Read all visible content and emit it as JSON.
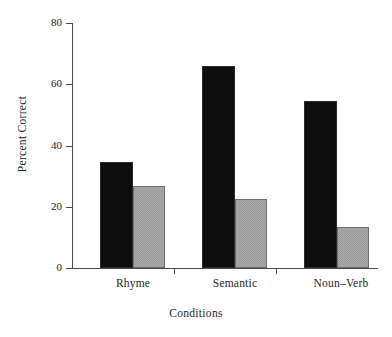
{
  "chart_data": {
    "type": "bar",
    "title": "",
    "subtitle": "",
    "xlabel": "Conditions",
    "ylabel": "Percent Correct",
    "categories": [
      "Rhyme",
      "Semantic",
      "Noun–Verb"
    ],
    "series": [
      {
        "name": "series-1-dark",
        "color": "#0d0d0d",
        "values": [
          34,
          65.5,
          54
        ]
      },
      {
        "name": "series-2-light",
        "color": "#9a9a9a",
        "values": [
          27,
          22,
          13
        ]
      }
    ],
    "ylim": [
      0,
      80
    ],
    "yticks": [
      0,
      20,
      40,
      60,
      80
    ],
    "ytick_labels": [
      "0",
      "20",
      "40",
      "60",
      "80"
    ],
    "grid": false,
    "legend": "none",
    "annotations": []
  },
  "axes": {
    "y_title": "Percent Correct",
    "x_title": "Conditions"
  }
}
